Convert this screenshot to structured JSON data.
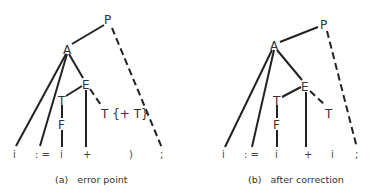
{
  "panels": [
    {
      "id": "a",
      "caption": "(a)   error point",
      "nodes": {
        "P": "P",
        "A": "A",
        "E": "E",
        "T1": "T",
        "F": "F",
        "T2": "T {+ T}"
      },
      "tokens": [
        "i",
        ": =",
        "i",
        "+",
        ")",
        ";"
      ]
    },
    {
      "id": "b",
      "caption": "(b)   after correction",
      "nodes": {
        "P": "P",
        "A": "A",
        "E": "E",
        "T1": "T",
        "F": "F",
        "T2": "T"
      },
      "tokens": [
        "i",
        ": =",
        "i",
        "+",
        "i",
        ";"
      ]
    }
  ]
}
